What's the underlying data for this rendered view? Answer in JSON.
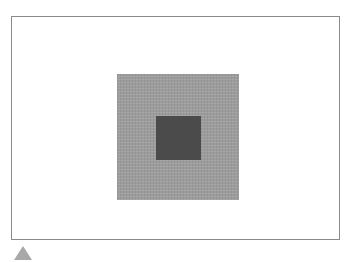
{
  "figure": {
    "frame": {
      "border_color": "#8a8a8a",
      "background": "#ffffff"
    },
    "outer_square": {
      "color": "#9c9c9c"
    },
    "inner_square": {
      "color": "#4b4b4b"
    },
    "marker": {
      "shape": "triangle-up",
      "color": "#a8a8a8"
    }
  }
}
